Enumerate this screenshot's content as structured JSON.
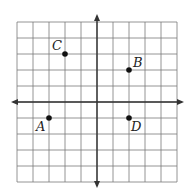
{
  "diagram": {
    "type": "coordinate-grid",
    "grid": {
      "x_min": -5,
      "x_max": 5,
      "y_min": -5,
      "y_max": 5,
      "cell_px": 16
    },
    "colors": {
      "grid": "#7a7a7a",
      "axis": "#333333",
      "point": "#111111",
      "background": "#ffffff"
    },
    "points": [
      {
        "label": "A",
        "x": -3,
        "y": -1
      },
      {
        "label": "B",
        "x": 2,
        "y": 2
      },
      {
        "label": "C",
        "x": -2,
        "y": 3
      },
      {
        "label": "D",
        "x": 2,
        "y": -1
      }
    ]
  }
}
